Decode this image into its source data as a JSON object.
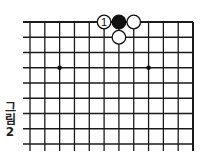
{
  "caption": {
    "line1": "그",
    "line2": "림",
    "line3": "2"
  },
  "board": {
    "columns": 12,
    "rows": 9,
    "x_start": 30,
    "x_step": 14.82,
    "y_start": 22,
    "y_step": 15.25,
    "left_extend": 23,
    "line_color": "#1a1a1a",
    "star_points": [
      {
        "col": 2,
        "row": 3
      },
      {
        "col": 8,
        "row": 3
      }
    ],
    "stones": [
      {
        "col": 5,
        "row": 0,
        "color": "white",
        "label": "1"
      },
      {
        "col": 6,
        "row": 0,
        "color": "black",
        "label": ""
      },
      {
        "col": 7,
        "row": 0,
        "color": "white",
        "label": ""
      },
      {
        "col": 6,
        "row": 1,
        "color": "white",
        "label": ""
      }
    ]
  }
}
